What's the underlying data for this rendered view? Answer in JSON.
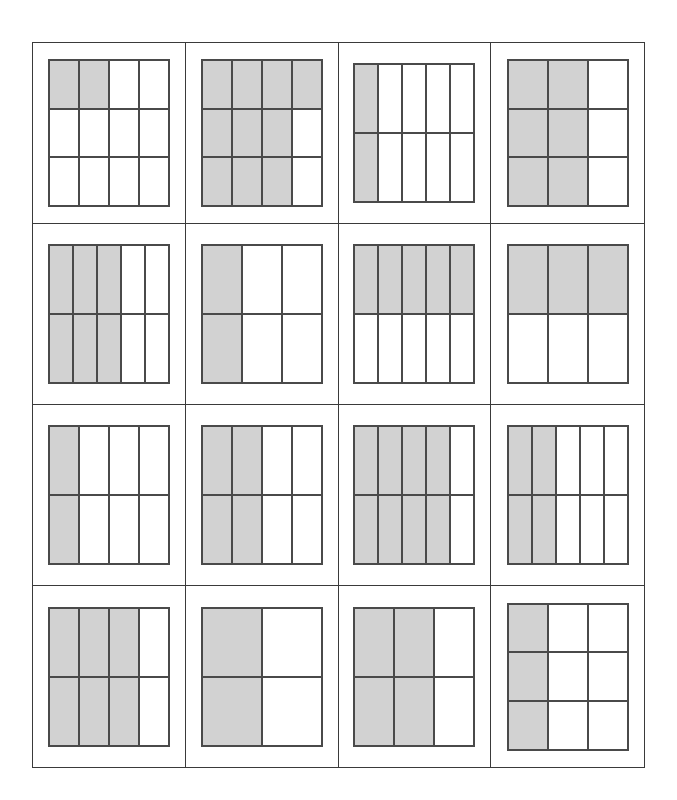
{
  "worksheet": {
    "title": "Fraction Area Models Worksheet",
    "layout": {
      "rows": 4,
      "columns": 4,
      "total_problems": 16
    },
    "colors": {
      "shaded_part": "#d2d2d2",
      "unshaded_part": "#ffffff",
      "part_outline": "#4a4a4a",
      "cell_divider": "#3a3a3a",
      "page_background": "#ffffff"
    },
    "problems": [
      {
        "number": 1,
        "row": 1,
        "column": 1,
        "columns": 4,
        "rows": 3,
        "total_parts": 12,
        "shaded_parts": 2,
        "fraction": "2/12",
        "shaded_pattern": "top-left-two-cells",
        "cells": [
          1,
          1,
          0,
          0,
          0,
          0,
          0,
          0,
          0,
          0,
          0,
          0
        ]
      },
      {
        "number": 2,
        "row": 1,
        "column": 2,
        "columns": 4,
        "rows": 3,
        "total_parts": 12,
        "shaded_parts": 10,
        "fraction": "10/12",
        "shaded_pattern": "all-but-right-of-rows-2-3",
        "cells": [
          1,
          1,
          1,
          1,
          1,
          1,
          1,
          0,
          1,
          1,
          1,
          0
        ]
      },
      {
        "number": 3,
        "row": 1,
        "column": 3,
        "columns": 5,
        "rows": 2,
        "total_parts": 10,
        "shaded_parts": 2,
        "fraction": "2/10",
        "shaded_pattern": "first-column",
        "cells": [
          1,
          0,
          0,
          0,
          0,
          1,
          0,
          0,
          0,
          0
        ]
      },
      {
        "number": 4,
        "row": 1,
        "column": 4,
        "columns": 3,
        "rows": 3,
        "total_parts": 9,
        "shaded_parts": 6,
        "fraction": "6/9",
        "shaded_pattern": "first-two-columns",
        "cells": [
          1,
          1,
          0,
          1,
          1,
          0,
          1,
          1,
          0
        ]
      },
      {
        "number": 5,
        "row": 2,
        "column": 1,
        "columns": 5,
        "rows": 2,
        "total_parts": 10,
        "shaded_parts": 6,
        "fraction": "6/10",
        "shaded_pattern": "first-three-columns",
        "cells": [
          1,
          1,
          1,
          0,
          0,
          1,
          1,
          1,
          0,
          0
        ]
      },
      {
        "number": 6,
        "row": 2,
        "column": 2,
        "columns": 3,
        "rows": 2,
        "total_parts": 6,
        "shaded_parts": 2,
        "fraction": "2/6",
        "shaded_pattern": "first-column",
        "cells": [
          1,
          0,
          0,
          1,
          0,
          0
        ]
      },
      {
        "number": 7,
        "row": 2,
        "column": 3,
        "columns": 5,
        "rows": 2,
        "total_parts": 10,
        "shaded_parts": 5,
        "fraction": "5/10",
        "shaded_pattern": "top-row",
        "cells": [
          1,
          1,
          1,
          1,
          1,
          0,
          0,
          0,
          0,
          0
        ]
      },
      {
        "number": 8,
        "row": 2,
        "column": 4,
        "columns": 3,
        "rows": 2,
        "total_parts": 6,
        "shaded_parts": 3,
        "fraction": "3/6",
        "shaded_pattern": "top-row",
        "cells": [
          1,
          1,
          1,
          0,
          0,
          0
        ]
      },
      {
        "number": 9,
        "row": 3,
        "column": 1,
        "columns": 4,
        "rows": 2,
        "total_parts": 8,
        "shaded_parts": 2,
        "fraction": "2/8",
        "shaded_pattern": "first-column",
        "cells": [
          1,
          0,
          0,
          0,
          1,
          0,
          0,
          0
        ]
      },
      {
        "number": 10,
        "row": 3,
        "column": 2,
        "columns": 4,
        "rows": 2,
        "total_parts": 8,
        "shaded_parts": 4,
        "fraction": "4/8",
        "shaded_pattern": "first-two-columns",
        "cells": [
          1,
          1,
          0,
          0,
          1,
          1,
          0,
          0
        ]
      },
      {
        "number": 11,
        "row": 3,
        "column": 3,
        "columns": 5,
        "rows": 2,
        "total_parts": 10,
        "shaded_parts": 8,
        "fraction": "8/10",
        "shaded_pattern": "first-four-columns",
        "cells": [
          1,
          1,
          1,
          1,
          0,
          1,
          1,
          1,
          1,
          0
        ]
      },
      {
        "number": 12,
        "row": 3,
        "column": 4,
        "columns": 5,
        "rows": 2,
        "total_parts": 10,
        "shaded_parts": 4,
        "fraction": "4/10",
        "shaded_pattern": "first-two-columns",
        "cells": [
          1,
          1,
          0,
          0,
          0,
          1,
          1,
          0,
          0,
          0
        ]
      },
      {
        "number": 13,
        "row": 4,
        "column": 1,
        "columns": 4,
        "rows": 2,
        "total_parts": 8,
        "shaded_parts": 6,
        "fraction": "6/8",
        "shaded_pattern": "first-three-columns",
        "cells": [
          1,
          1,
          1,
          0,
          1,
          1,
          1,
          0
        ]
      },
      {
        "number": 14,
        "row": 4,
        "column": 2,
        "columns": 2,
        "rows": 2,
        "total_parts": 4,
        "shaded_parts": 2,
        "fraction": "2/4",
        "shaded_pattern": "first-column",
        "cells": [
          1,
          0,
          1,
          0
        ]
      },
      {
        "number": 15,
        "row": 4,
        "column": 3,
        "columns": 3,
        "rows": 2,
        "total_parts": 6,
        "shaded_parts": 4,
        "fraction": "4/6",
        "shaded_pattern": "first-two-columns",
        "cells": [
          1,
          1,
          0,
          1,
          1,
          0
        ]
      },
      {
        "number": 16,
        "row": 4,
        "column": 4,
        "columns": 3,
        "rows": 3,
        "total_parts": 9,
        "shaded_parts": 3,
        "fraction": "3/9",
        "shaded_pattern": "first-column",
        "cells": [
          1,
          0,
          0,
          1,
          0,
          0,
          1,
          0,
          0
        ]
      }
    ]
  }
}
